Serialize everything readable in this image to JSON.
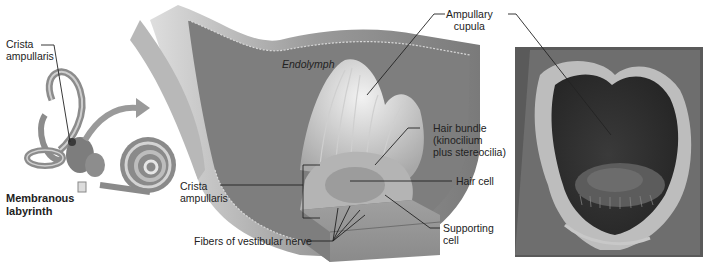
{
  "figure": {
    "panels": [
      {
        "id": "labyrinth",
        "description": "Membranous labyrinth overview with arrow to ampulla"
      },
      {
        "id": "ampulla-section",
        "description": "Cutaway of ampulla showing crista ampullaris and cupula"
      },
      {
        "id": "sem-micrograph",
        "description": "Scanning electron micrograph of ampullary cupula"
      }
    ],
    "labels": {
      "crista_left": "Crista\nampullaris",
      "membranous_labyrinth": "Membranous\nlabyrinth",
      "endolymph": "Endolymph",
      "ampullary_cupula": "Ampullary\ncupula",
      "hair_bundle": "Hair bundle\n(kinocilium\nplus stereocilia)",
      "hair_cell": "Hair cell",
      "crista_center": "Crista\nampullaris",
      "supporting_cell": "Supporting\ncell",
      "fibers": "Fibers of vestibular nerve"
    },
    "colors": {
      "background": "#ffffff",
      "leader_line": "#222222",
      "tissue_gray": "#8a8a8a",
      "micrograph_dark": "#2e2e2e"
    }
  }
}
